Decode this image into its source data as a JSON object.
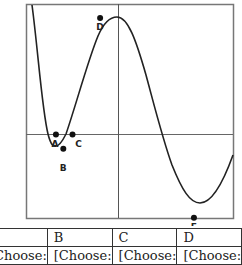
{
  "graph": {
    "points": [
      {
        "label": "A",
        "x": -0.68,
        "y": 0.0
      },
      {
        "label": "B",
        "x": -0.6,
        "y": -0.12
      },
      {
        "label": "C",
        "x": -0.5,
        "y": 0.0
      },
      {
        "label": "D",
        "x": -0.2,
        "y": 0.98
      },
      {
        "label": "E",
        "x": 0.82,
        "y": -0.7
      }
    ]
  },
  "table": {
    "headers": [
      "A",
      "B",
      "C",
      "D"
    ],
    "row": [
      "[Choose:",
      "[Choose:",
      "[Choose:",
      "[Choose:"
    ]
  }
}
